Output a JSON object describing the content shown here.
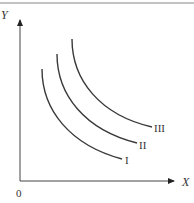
{
  "diagram": {
    "type": "indifference-curves",
    "axes": {
      "x_label": "X",
      "y_label": "Y",
      "origin_label": "0"
    },
    "curves": [
      {
        "id": "I",
        "label": "I",
        "start": [
          42,
          69
        ],
        "end": [
          122,
          159
        ],
        "label_pos": [
          125,
          164
        ]
      },
      {
        "id": "II",
        "label": "II",
        "start": [
          57,
          54
        ],
        "end": [
          137,
          143
        ],
        "label_pos": [
          139,
          149
        ]
      },
      {
        "id": "III",
        "label": "III",
        "start": [
          72,
          39
        ],
        "end": [
          152,
          127
        ],
        "label_pos": [
          154,
          132
        ]
      }
    ],
    "colors": {
      "line": "#3a3a3a",
      "border": "#888888",
      "text": "#333333"
    }
  }
}
